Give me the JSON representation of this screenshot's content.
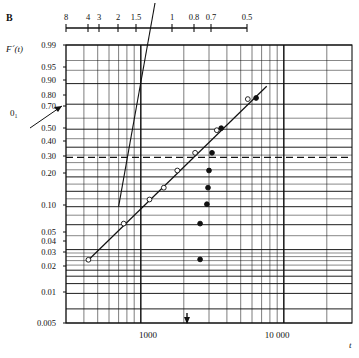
{
  "panel": {
    "letter": "B"
  },
  "axes": {
    "y_title": "F´(t)",
    "x_title": "t",
    "origin_label": "0₁",
    "y_ticks": [
      {
        "label": "0.99",
        "y": 45
      },
      {
        "label": "0.95",
        "y": 67
      },
      {
        "label": "0.90",
        "y": 80
      },
      {
        "label": "0.80",
        "y": 95
      },
      {
        "label": "0.70",
        "y": 106
      },
      {
        "label": "",
        "y": 113
      },
      {
        "label": "0.50",
        "y": 128
      },
      {
        "label": "0.40",
        "y": 141
      },
      {
        "label": "0.30",
        "y": 156
      },
      {
        "label": "0.20",
        "y": 173
      },
      {
        "label": "0.10",
        "y": 205
      },
      {
        "label": "0.05",
        "y": 232
      },
      {
        "label": "0.04",
        "y": 241
      },
      {
        "label": "0.03",
        "y": 252
      },
      {
        "label": "0.02",
        "y": 266
      },
      {
        "label": "0.01",
        "y": 292
      },
      {
        "label": "0.005",
        "y": 323
      }
    ],
    "x_ticks": [
      {
        "label": "1000",
        "x": 148
      },
      {
        "label": "10 000",
        "x": 277
      }
    ]
  },
  "ruler": {
    "ticks": [
      {
        "label": "8",
        "x": 66
      },
      {
        "label": "4",
        "x": 88
      },
      {
        "label": "3",
        "x": 99
      },
      {
        "label": "2",
        "x": 118
      },
      {
        "label": "1.5",
        "x": 136
      },
      {
        "label": "1",
        "x": 172
      },
      {
        "label": "0.8",
        "x": 194
      },
      {
        "label": "0.7",
        "x": 211
      },
      {
        "label": "0.5",
        "x": 247
      }
    ]
  },
  "chart_data": {
    "type": "scatter",
    "title": "",
    "xlabel": "t",
    "ylabel": "F´(t)",
    "x_scale": "log",
    "y_scale": "probability",
    "xlim": [
      300,
      30000
    ],
    "ylim": [
      0.005,
      0.99
    ],
    "grid": true,
    "legend": "none",
    "reference_line": {
      "name": "dashed reference",
      "value": 0.635,
      "style": "dashed"
    },
    "fit_line": {
      "name": "fitted line",
      "x": [
        420,
        7600
      ],
      "y": [
        0.068,
        0.945
      ]
    },
    "shape_line": {
      "name": "slope ruler guide",
      "x": [
        700,
        2050
      ],
      "y": [
        0.3,
        0.999
      ]
    },
    "series": [
      {
        "name": "open circles",
        "marker": "open-circle",
        "points": [
          {
            "x": 430,
            "y": 0.072
          },
          {
            "x": 760,
            "y": 0.205
          },
          {
            "x": 1150,
            "y": 0.345
          },
          {
            "x": 1450,
            "y": 0.425
          },
          {
            "x": 1800,
            "y": 0.545
          },
          {
            "x": 2400,
            "y": 0.665
          },
          {
            "x": 3400,
            "y": 0.795
          },
          {
            "x": 5600,
            "y": 0.915
          }
        ]
      },
      {
        "name": "filled circles",
        "marker": "filled-circle",
        "points": [
          {
            "x": 2600,
            "y": 0.073
          },
          {
            "x": 2600,
            "y": 0.205
          },
          {
            "x": 2900,
            "y": 0.315
          },
          {
            "x": 2950,
            "y": 0.425
          },
          {
            "x": 3000,
            "y": 0.545
          },
          {
            "x": 3150,
            "y": 0.665
          },
          {
            "x": 3650,
            "y": 0.805
          },
          {
            "x": 6400,
            "y": 0.918
          }
        ]
      }
    ]
  }
}
